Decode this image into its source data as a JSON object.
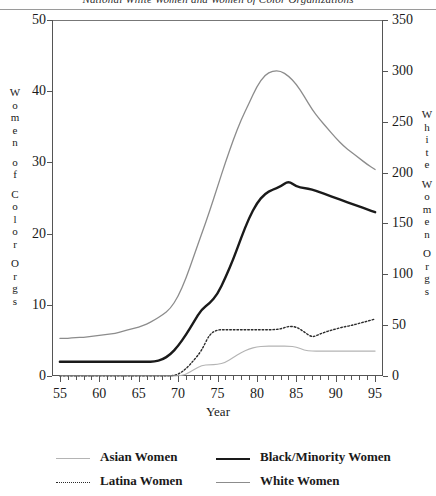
{
  "title": "National White Women and Women of Color Organizations",
  "axis_titles": {
    "left": "Women of Color Orgs",
    "right": "White Women Orgs",
    "x": "Year"
  },
  "legend": [
    {
      "label": "Asian Women",
      "style": "thin-solid-gray",
      "color": "#b4b4b4"
    },
    {
      "label": "Black/Minority Women",
      "style": "thick-solid-black",
      "color": "#1a1a1a"
    },
    {
      "label": "Latina Women",
      "style": "dotted",
      "color": "#2b2b2b"
    },
    {
      "label": "White Women",
      "style": "solid-gray",
      "color": "#8c8c8c"
    }
  ],
  "chart_data": {
    "type": "line",
    "title": "National White Women and Women of Color Organizations",
    "xlabel": "Year",
    "ylabel": "Women of Color Orgs",
    "y2label": "White Women Orgs",
    "xlim": [
      54,
      96
    ],
    "ylim": [
      0,
      50
    ],
    "y2lim": [
      0,
      350
    ],
    "xticks": [
      55,
      60,
      65,
      70,
      75,
      80,
      85,
      90,
      95
    ],
    "xticks_minor_step": 1,
    "yticks_left": [
      0,
      10,
      20,
      30,
      40,
      50
    ],
    "yticks_right": [
      0,
      50,
      100,
      150,
      200,
      250,
      300,
      350
    ],
    "grid": false,
    "legend_position": "below",
    "x": [
      55,
      56,
      57,
      58,
      59,
      60,
      61,
      62,
      63,
      64,
      65,
      66,
      67,
      68,
      69,
      70,
      71,
      72,
      73,
      74,
      75,
      76,
      77,
      78,
      79,
      80,
      81,
      82,
      83,
      84,
      85,
      86,
      87,
      88,
      89,
      90,
      91,
      92,
      93,
      94,
      95
    ],
    "series": [
      {
        "name": "White Women",
        "axis": "right",
        "units": "organizations",
        "values": [
          37,
          37,
          38,
          38,
          39,
          40,
          41,
          42,
          44,
          46,
          48,
          51,
          55,
          60,
          66,
          78,
          96,
          118,
          140,
          162,
          186,
          210,
          232,
          252,
          268,
          285,
          296,
          300,
          300,
          295,
          287,
          275,
          262,
          252,
          243,
          234,
          226,
          220,
          214,
          208,
          203
        ]
      },
      {
        "name": "Black/Minority Women",
        "axis": "left",
        "units": "organizations",
        "values": [
          2,
          2,
          2,
          2,
          2,
          2,
          2,
          2,
          2,
          2,
          2,
          2,
          2,
          2.3,
          3,
          4.2,
          5.8,
          7.6,
          9.4,
          10.2,
          11.5,
          13.8,
          16.4,
          19.4,
          22.2,
          24.3,
          25.6,
          26.2,
          26.6,
          27.4,
          26.6,
          26.4,
          26.2,
          25.8,
          25.4,
          25.0,
          24.6,
          24.2,
          23.8,
          23.4,
          23.0
        ]
      },
      {
        "name": "Latina Women",
        "axis": "left",
        "units": "organizations",
        "values": [
          0,
          0,
          0,
          0,
          0,
          0,
          0,
          0,
          0,
          0,
          0,
          0,
          0,
          0,
          0,
          0.2,
          1.0,
          2.2,
          3.6,
          5.9,
          6.5,
          6.5,
          6.5,
          6.5,
          6.5,
          6.5,
          6.5,
          6.5,
          6.6,
          7.0,
          6.9,
          6.2,
          5.4,
          5.9,
          6.3,
          6.6,
          6.9,
          7.1,
          7.4,
          7.7,
          8.0
        ]
      },
      {
        "name": "Asian Women",
        "axis": "left",
        "units": "organizations",
        "values": [
          0,
          0,
          0,
          0,
          0,
          0,
          0,
          0,
          0,
          0,
          0,
          0,
          0,
          0,
          0,
          0,
          0.2,
          0.9,
          1.5,
          1.6,
          1.6,
          1.9,
          2.6,
          3.3,
          3.8,
          4.1,
          4.2,
          4.2,
          4.2,
          4.2,
          4.1,
          3.6,
          3.5,
          3.5,
          3.5,
          3.5,
          3.5,
          3.5,
          3.5,
          3.5,
          3.5
        ]
      }
    ]
  }
}
